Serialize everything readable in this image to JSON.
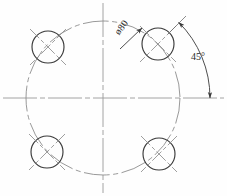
{
  "drawing": {
    "title": "bolt-circle-pattern",
    "labels": {
      "diameter": "ø80",
      "angle": "45°"
    },
    "colors": {
      "object_line": "#3a3a3a",
      "thin_line": "#6f6f6f",
      "center_line": "#9a9a9a",
      "background": "#fefefe",
      "text": "#2a2a2a"
    }
  },
  "geometry": {
    "center": {
      "x": 103,
      "y": 98
    },
    "bolt_circle": {
      "radius": 77,
      "diameter_label": "ø80"
    },
    "hole_radius": 16,
    "holes": [
      {
        "name": "hole-top-left",
        "x": 48,
        "y": 47,
        "angle_deg": 135
      },
      {
        "name": "hole-top-right",
        "x": 158,
        "y": 44,
        "angle_deg": 45
      },
      {
        "name": "hole-bottom-left",
        "x": 47,
        "y": 152,
        "angle_deg": 225
      },
      {
        "name": "hole-bottom-right",
        "x": 159,
        "y": 154,
        "angle_deg": 315
      }
    ],
    "centerlines": {
      "horizontal": {
        "x1": 3,
        "y1": 98,
        "x2": 224,
        "y2": 98
      },
      "vertical": {
        "x1": 103,
        "y1": 3,
        "x2": 103,
        "y2": 193
      }
    },
    "angle_dimension": {
      "value": "45°",
      "radius": 107,
      "start_angle_deg": 45,
      "end_angle_deg": 0
    }
  }
}
